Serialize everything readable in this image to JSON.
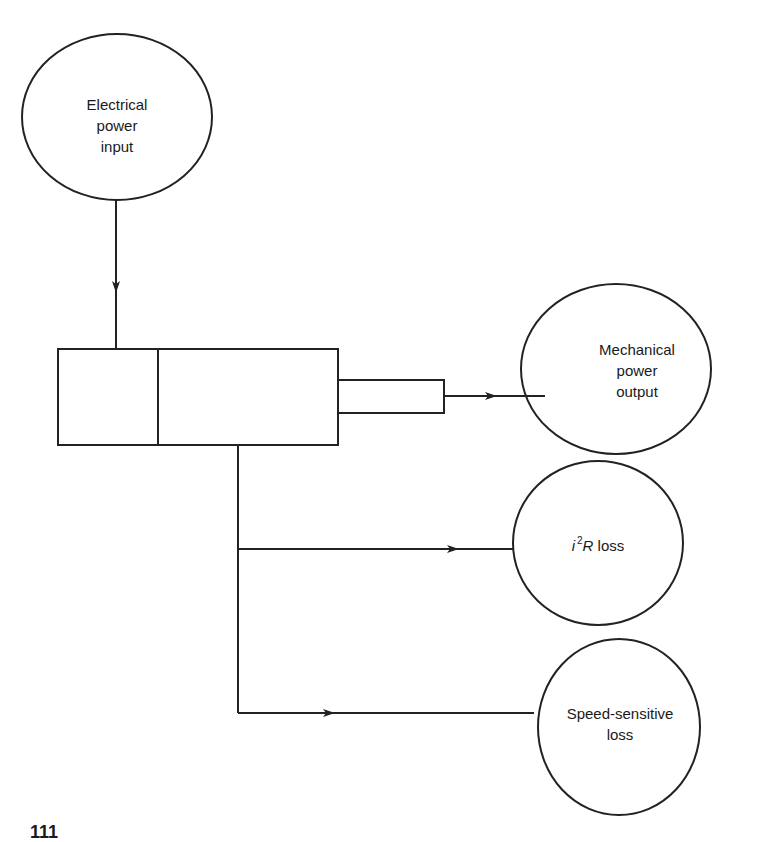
{
  "nodes": {
    "input": {
      "line1": "Electrical",
      "line2": "power",
      "line3": "input"
    },
    "mech_output": {
      "line1": "Mechanical",
      "line2": "power",
      "line3": "output"
    },
    "i2r_loss": {
      "i": "i",
      "exp": "2",
      "r": "R",
      "rest": " loss"
    },
    "speed_loss": {
      "line1": "Speed-sensitive",
      "line2": "loss"
    }
  },
  "caption": "111"
}
